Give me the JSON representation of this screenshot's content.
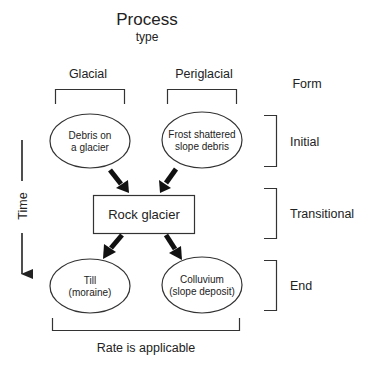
{
  "header": {
    "title": "Process",
    "subtitle": "type"
  },
  "columns": [
    {
      "label": "Glacial"
    },
    {
      "label": "Periglacial"
    }
  ],
  "form": {
    "label": "Form",
    "stages": [
      {
        "label": "Initial"
      },
      {
        "label": "Transitional"
      },
      {
        "label": "End"
      }
    ]
  },
  "nodes": {
    "debris_on_glacier": {
      "line1": "Debris on",
      "line2": "a glacier"
    },
    "frost_shattered": {
      "line1": "Frost shattered",
      "line2": "slope debris"
    },
    "rock_glacier": {
      "label": "Rock glacier"
    },
    "till": {
      "line1": "Till",
      "line2": "(moraine)"
    },
    "colluvium": {
      "line1": "Colluvium",
      "line2": "(slope deposit)"
    }
  },
  "time_axis": {
    "label": "Time"
  },
  "footer": {
    "label": "Rate is applicable"
  },
  "colors": {
    "stroke": "#333333",
    "text": "#222222",
    "background": "#ffffff"
  }
}
